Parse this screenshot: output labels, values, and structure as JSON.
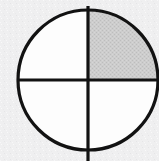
{
  "figure": {
    "kind": "fraction-circle-diagram",
    "background_color": "#efeff0",
    "stroke_color": "#121212",
    "stroke_width": 3.2,
    "circle": {
      "center_x": 88,
      "center_y": 80,
      "radius": 70,
      "unshaded_fill": "#fdfdfd"
    },
    "divider_lines": [
      {
        "name": "vertical-diameter",
        "orientation": "vertical",
        "x1": 88,
        "y1": 6,
        "x2": 88,
        "y2": 161
      },
      {
        "name": "horizontal-diameter",
        "orientation": "horizontal",
        "x1": 17,
        "y1": 80,
        "x2": 159,
        "y2": 80
      }
    ],
    "quadrants": [
      {
        "name": "upper-left",
        "shaded": false,
        "fill": "#fdfdfd",
        "path": "M 88 80 L 88 10 A 70 70 0 0 0 18 80 Z"
      },
      {
        "name": "upper-right",
        "shaded": true,
        "fill": "#c9c9c9",
        "path": "M 88 80 L 88 10 A 70 70 0 0 1 158 80 Z"
      },
      {
        "name": "lower-right",
        "shaded": false,
        "fill": "#fdfdfd",
        "path": "M 88 80 L 158 80 A 70 70 0 0 1 88 150 Z"
      },
      {
        "name": "lower-left",
        "shaded": false,
        "fill": "#fdfdfd",
        "path": "M 88 80 L 88 150 A 70 70 0 0 1 18 80 Z"
      }
    ],
    "shaded_count": 1,
    "total_parts": 4,
    "shaded_fraction_label": "1/4"
  }
}
